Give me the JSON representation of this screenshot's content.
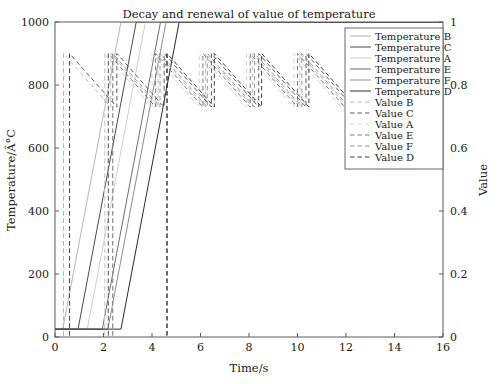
{
  "chart_data": {
    "type": "line",
    "title": "Decay and renewal of value of temperature",
    "xlabel": "Time/s",
    "ylabel": "Temperature/Â°C",
    "y2label": "Value",
    "xlim": [
      0,
      16
    ],
    "ylim": [
      0,
      1000
    ],
    "y2lim": [
      0,
      1
    ],
    "xticks": [
      "0",
      "2",
      "4",
      "6",
      "8",
      "10",
      "12",
      "14",
      "16"
    ],
    "xtick_values": [
      0,
      2,
      4,
      6,
      8,
      10,
      12,
      14,
      16
    ],
    "yticks": [
      "0",
      "200",
      "400",
      "600",
      "800",
      "1000"
    ],
    "ytick_values": [
      0,
      200,
      400,
      600,
      800,
      1000
    ],
    "y2ticks": [
      "0",
      "0.2",
      "0.4",
      "0.6",
      "0.8",
      "1"
    ],
    "y2tick_values": [
      0,
      0.2,
      0.4,
      0.6,
      0.8,
      1.0
    ],
    "grid": false,
    "legend_position": "upper right",
    "baseline_temperature": 25,
    "series": [
      {
        "name": "Temperature B",
        "style": "solid",
        "color": "#b4b4b4",
        "axis": "left",
        "points": [
          [
            0.0,
            25
          ],
          [
            0.32,
            25
          ],
          [
            2.72,
            1000
          ],
          [
            16,
            1000
          ]
        ]
      },
      {
        "name": "Temperature C",
        "style": "solid",
        "color": "#4a4a4a",
        "axis": "left",
        "points": [
          [
            0.0,
            25
          ],
          [
            0.95,
            25
          ],
          [
            3.35,
            1000
          ],
          [
            16,
            1000
          ]
        ]
      },
      {
        "name": "Temperature A",
        "style": "solid",
        "color": "#cfcfcf",
        "axis": "left",
        "points": [
          [
            0.0,
            25
          ],
          [
            1.33,
            25
          ],
          [
            3.73,
            1000
          ],
          [
            16,
            1000
          ]
        ]
      },
      {
        "name": "Temperature E",
        "style": "solid",
        "color": "#6e6e6e",
        "axis": "left",
        "points": [
          [
            0.0,
            25
          ],
          [
            1.95,
            25
          ],
          [
            4.35,
            1000
          ],
          [
            16,
            1000
          ]
        ]
      },
      {
        "name": "Temperature F",
        "style": "solid",
        "color": "#8c8c8c",
        "axis": "left",
        "points": [
          [
            0.0,
            25
          ],
          [
            2.18,
            25
          ],
          [
            4.58,
            1000
          ],
          [
            16,
            1000
          ]
        ]
      },
      {
        "name": "Temperature D",
        "style": "solid",
        "color": "#2b2b2b",
        "axis": "left",
        "points": [
          [
            0.0,
            25
          ],
          [
            2.72,
            25
          ],
          [
            5.12,
            1000
          ],
          [
            16,
            1000
          ]
        ]
      },
      {
        "name": "Value B",
        "style": "dashed",
        "color": "#b4b4b4",
        "axis": "right",
        "points": [
          [
            0.35,
            0.9
          ],
          [
            0.35,
            0.0
          ],
          [
            0.35,
            0.9
          ],
          [
            2.3,
            0.73
          ],
          [
            2.3,
            0.9
          ],
          [
            4.25,
            0.73
          ],
          [
            4.25,
            0.9
          ],
          [
            6.2,
            0.73
          ],
          [
            6.2,
            0.9
          ],
          [
            8.15,
            0.73
          ],
          [
            8.15,
            0.9
          ],
          [
            10.1,
            0.73
          ],
          [
            10.1,
            0.9
          ],
          [
            12.05,
            0.73
          ]
        ]
      },
      {
        "name": "Value C",
        "style": "dashed",
        "color": "#4a4a4a",
        "axis": "right",
        "points": [
          [
            0.6,
            0.9
          ],
          [
            0.6,
            0.0
          ],
          [
            0.6,
            0.9
          ],
          [
            2.55,
            0.73
          ],
          [
            2.55,
            0.9
          ],
          [
            4.5,
            0.73
          ],
          [
            4.5,
            0.9
          ],
          [
            6.45,
            0.73
          ],
          [
            6.45,
            0.9
          ],
          [
            8.4,
            0.73
          ],
          [
            8.4,
            0.9
          ],
          [
            10.35,
            0.73
          ],
          [
            10.35,
            0.9
          ],
          [
            12.3,
            0.73
          ]
        ]
      },
      {
        "name": "Value A",
        "style": "dashed",
        "color": "#cfcfcf",
        "axis": "right",
        "points": [
          [
            2.05,
            0.9
          ],
          [
            2.05,
            0.0
          ],
          [
            2.05,
            0.9
          ],
          [
            4.0,
            0.73
          ],
          [
            4.0,
            0.9
          ],
          [
            5.95,
            0.73
          ],
          [
            5.95,
            0.9
          ],
          [
            7.9,
            0.73
          ],
          [
            7.9,
            0.9
          ],
          [
            9.85,
            0.73
          ],
          [
            9.85,
            0.9
          ],
          [
            11.8,
            0.73
          ]
        ]
      },
      {
        "name": "Value E",
        "style": "dashed",
        "color": "#6e6e6e",
        "axis": "right",
        "points": [
          [
            2.2,
            0.9
          ],
          [
            2.2,
            0.0
          ],
          [
            2.2,
            0.9
          ],
          [
            4.15,
            0.73
          ],
          [
            4.15,
            0.9
          ],
          [
            6.1,
            0.73
          ],
          [
            6.1,
            0.9
          ],
          [
            8.05,
            0.73
          ],
          [
            8.05,
            0.9
          ],
          [
            10.0,
            0.73
          ],
          [
            10.0,
            0.9
          ],
          [
            11.95,
            0.73
          ]
        ]
      },
      {
        "name": "Value F",
        "style": "dashed",
        "color": "#8c8c8c",
        "axis": "right",
        "points": [
          [
            2.38,
            0.9
          ],
          [
            2.38,
            0.0
          ],
          [
            2.38,
            0.9
          ],
          [
            4.33,
            0.73
          ],
          [
            4.33,
            0.9
          ],
          [
            6.28,
            0.73
          ],
          [
            6.28,
            0.9
          ],
          [
            8.23,
            0.73
          ],
          [
            8.23,
            0.9
          ],
          [
            10.18,
            0.73
          ],
          [
            10.18,
            0.9
          ],
          [
            12.13,
            0.73
          ]
        ]
      },
      {
        "name": "Value D",
        "style": "dashed",
        "color": "#2b2b2b",
        "axis": "right",
        "points": [
          [
            4.62,
            0.9
          ],
          [
            4.62,
            0.0
          ],
          [
            4.62,
            0.9
          ],
          [
            6.57,
            0.73
          ],
          [
            6.57,
            0.9
          ],
          [
            8.52,
            0.73
          ],
          [
            8.52,
            0.9
          ],
          [
            10.47,
            0.73
          ],
          [
            10.47,
            0.9
          ],
          [
            12.42,
            0.73
          ]
        ]
      }
    ],
    "legend": [
      {
        "label": "Temperature B",
        "style": "solid",
        "color": "#b4b4b4"
      },
      {
        "label": "Temperature C",
        "style": "solid",
        "color": "#4a4a4a"
      },
      {
        "label": "Temperature A",
        "style": "solid",
        "color": "#cfcfcf"
      },
      {
        "label": "Temperature E",
        "style": "solid",
        "color": "#6e6e6e"
      },
      {
        "label": "Temperature F",
        "style": "solid",
        "color": "#8c8c8c"
      },
      {
        "label": "Temperature D",
        "style": "solid",
        "color": "#2b2b2b"
      },
      {
        "label": "Value B",
        "style": "dashed",
        "color": "#b4b4b4"
      },
      {
        "label": "Value C",
        "style": "dashed",
        "color": "#4a4a4a"
      },
      {
        "label": "Value A",
        "style": "dashed",
        "color": "#cfcfcf"
      },
      {
        "label": "Value E",
        "style": "dashed",
        "color": "#6e6e6e"
      },
      {
        "label": "Value F",
        "style": "dashed",
        "color": "#8c8c8c"
      },
      {
        "label": "Value D",
        "style": "dashed",
        "color": "#2b2b2b"
      }
    ]
  }
}
